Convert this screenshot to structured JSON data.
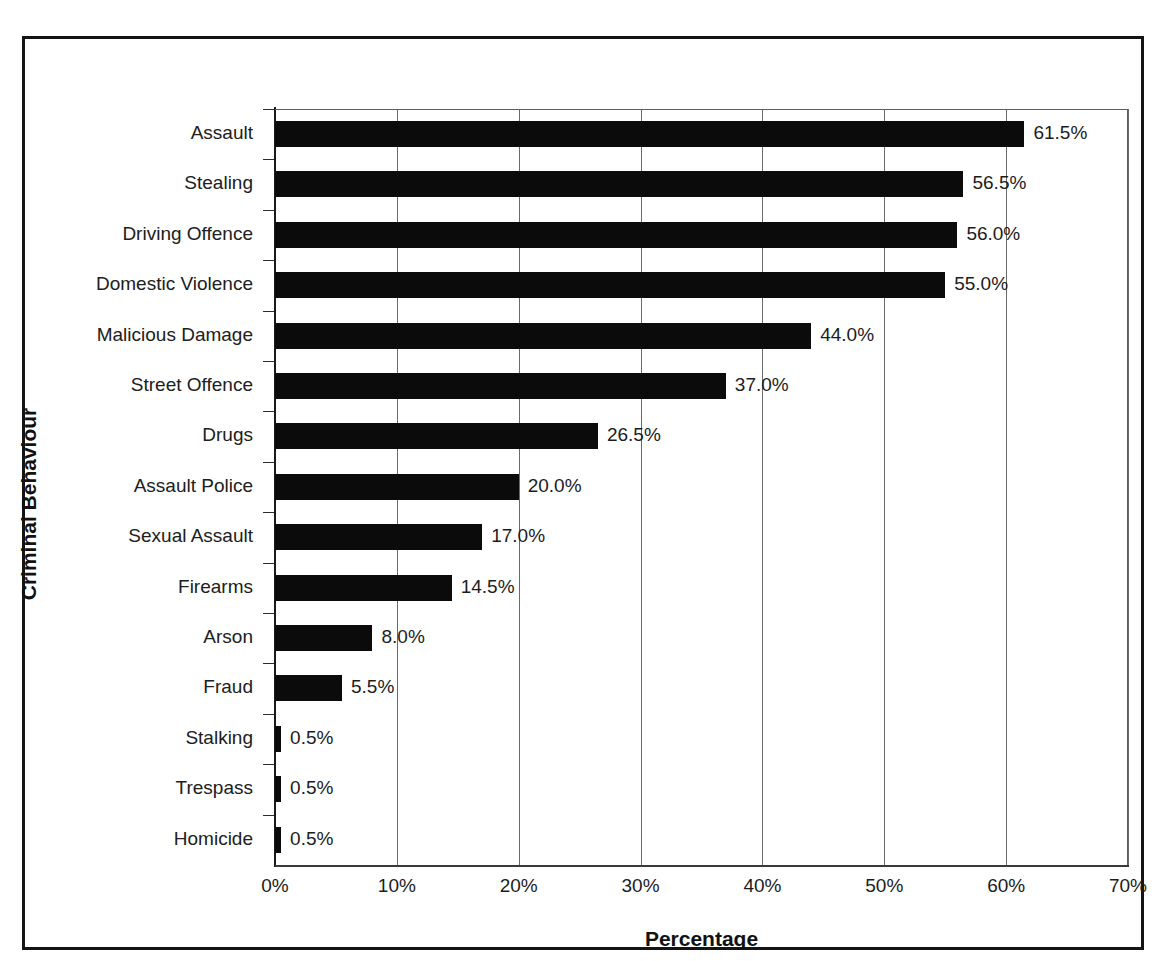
{
  "chart_data": {
    "type": "bar",
    "orientation": "horizontal",
    "title": "",
    "xlabel": "Percentage",
    "ylabel": "Criminal Behaviour",
    "xlim": [
      0,
      70
    ],
    "x_tick_labels": [
      "0%",
      "10%",
      "20%",
      "30%",
      "40%",
      "50%",
      "60%",
      "70%"
    ],
    "x_ticks": [
      0,
      10,
      20,
      30,
      40,
      50,
      60,
      70
    ],
    "grid": "vertical",
    "legend": "none",
    "bar_color": "#0b0b0b",
    "categories": [
      "Assault",
      "Stealing",
      "Driving Offence",
      "Domestic Violence",
      "Malicious Damage",
      "Street Offence",
      "Drugs",
      "Assault Police",
      "Sexual Assault",
      "Firearms",
      "Arson",
      "Fraud",
      "Stalking",
      "Trespass",
      "Homicide"
    ],
    "values": [
      61.5,
      56.5,
      56.0,
      55.0,
      44.0,
      37.0,
      26.5,
      20.0,
      17.0,
      14.5,
      8.0,
      5.5,
      0.5,
      0.5,
      0.5
    ],
    "data_labels": [
      "61.5%",
      "56.5%",
      "56.0%",
      "55.0%",
      "44.0%",
      "37.0%",
      "26.5%",
      "20.0%",
      "17.0%",
      "14.5%",
      "8.0%",
      "5.5%",
      "0.5%",
      "0.5%",
      "0.5%"
    ]
  }
}
